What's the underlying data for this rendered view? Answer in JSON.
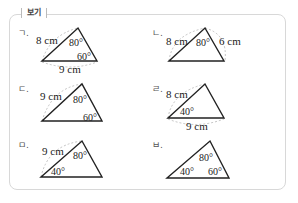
{
  "header": {
    "title": "보기"
  },
  "items": [
    {
      "label": "ㄱ.",
      "sides": [
        "8 cm",
        "9 cm"
      ],
      "angles": [
        "80°",
        "60°"
      ]
    },
    {
      "label": "ㄴ.",
      "sides": [
        "8 cm",
        "6 cm"
      ],
      "angles": [
        "80°"
      ]
    },
    {
      "label": "ㄷ.",
      "sides": [
        "9 cm"
      ],
      "angles": [
        "80°",
        "60°"
      ]
    },
    {
      "label": "ㄹ.",
      "sides": [
        "8 cm",
        "9 cm"
      ],
      "angles": [
        "40°"
      ]
    },
    {
      "label": "ㅁ.",
      "sides": [
        "9 cm"
      ],
      "angles": [
        "80°",
        "40°"
      ]
    },
    {
      "label": "ㅂ.",
      "sides": [],
      "angles": [
        "80°",
        "40°",
        "60°"
      ]
    }
  ]
}
